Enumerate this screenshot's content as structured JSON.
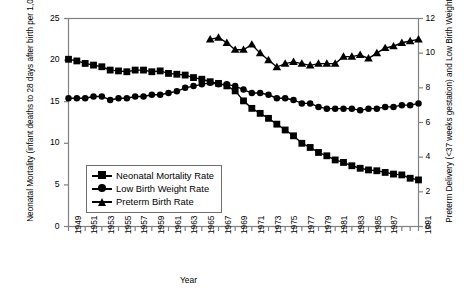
{
  "chart_data": {
    "type": "line",
    "title": "",
    "xlabel": "Year",
    "ylabel": "Neonatal Mortality (infant deaths to 28 days after birth per 1,000 live births)",
    "ylabel_right": "Preterm Delivery (<37 weeks gestation) and Low Birth Weight (<2,500 grams) (per 100 live births)",
    "ylim": [
      0,
      25
    ],
    "ylim_right": [
      0,
      12
    ],
    "yticks": [
      0,
      5,
      10,
      15,
      20,
      25
    ],
    "yticks_right": [
      0,
      2,
      4,
      6,
      8,
      10,
      12
    ],
    "xlim": [
      1949,
      1991
    ],
    "xticks": [
      1949,
      1950,
      1951,
      1952,
      1953,
      1954,
      1955,
      1956,
      1957,
      1958,
      1959,
      1960,
      1961,
      1962,
      1963,
      1964,
      1965,
      1966,
      1967,
      1968,
      1969,
      1970,
      1971,
      1972,
      1973,
      1974,
      1975,
      1976,
      1977,
      1978,
      1979,
      1980,
      1981,
      1982,
      1983,
      1984,
      1985,
      1986,
      1987,
      1988,
      1989,
      1990,
      1991
    ],
    "xtick_labels": [
      "1949",
      "",
      "1951",
      "",
      "1953",
      "",
      "1955",
      "",
      "1957",
      "",
      "1959",
      "",
      "1961",
      "",
      "1963",
      "",
      "1965",
      "",
      "1967",
      "",
      "1969",
      "",
      "1971",
      "",
      "1973",
      "",
      "1975",
      "",
      "1977",
      "",
      "1979",
      "",
      "1981",
      "",
      "1983",
      "",
      "1985",
      "",
      "1987",
      "",
      "",
      "",
      "1991"
    ],
    "grid": false,
    "legend_position": "lower-left-inside",
    "series": [
      {
        "name": "Neonatal Mortality Rate",
        "marker": "square",
        "axis": "left",
        "x": [
          1949,
          1950,
          1951,
          1952,
          1953,
          1954,
          1955,
          1956,
          1957,
          1958,
          1959,
          1960,
          1961,
          1962,
          1963,
          1964,
          1965,
          1966,
          1967,
          1968,
          1969,
          1970,
          1971,
          1972,
          1973,
          1974,
          1975,
          1976,
          1977,
          1978,
          1979,
          1980,
          1981,
          1982,
          1983,
          1984,
          1985,
          1986,
          1987,
          1988,
          1989,
          1990,
          1991
        ],
        "values": [
          20.1,
          19.9,
          19.6,
          19.4,
          19.2,
          18.8,
          18.7,
          18.6,
          18.8,
          18.8,
          18.6,
          18.7,
          18.4,
          18.3,
          18.2,
          17.9,
          17.7,
          17.4,
          17.2,
          16.9,
          16.3,
          15.1,
          14.2,
          13.6,
          13.0,
          12.3,
          11.6,
          10.9,
          10.0,
          9.5,
          8.9,
          8.5,
          8.0,
          7.7,
          7.3,
          7.0,
          6.8,
          6.7,
          6.5,
          6.3,
          6.2,
          5.8,
          5.6
        ]
      },
      {
        "name": "Low Birth Weight Rate",
        "marker": "circle",
        "axis": "right",
        "x": [
          1949,
          1950,
          1951,
          1952,
          1953,
          1954,
          1955,
          1956,
          1957,
          1958,
          1959,
          1960,
          1961,
          1962,
          1963,
          1964,
          1965,
          1966,
          1967,
          1968,
          1969,
          1970,
          1971,
          1972,
          1973,
          1974,
          1975,
          1976,
          1977,
          1978,
          1979,
          1980,
          1981,
          1982,
          1983,
          1984,
          1985,
          1986,
          1987,
          1988,
          1989,
          1990,
          1991
        ],
        "values": [
          7.4,
          7.4,
          7.4,
          7.5,
          7.5,
          7.3,
          7.4,
          7.4,
          7.5,
          7.5,
          7.6,
          7.6,
          7.7,
          7.8,
          8.0,
          8.1,
          8.2,
          8.3,
          8.2,
          8.2,
          8.1,
          7.9,
          7.7,
          7.7,
          7.6,
          7.4,
          7.4,
          7.3,
          7.1,
          7.1,
          6.9,
          6.8,
          6.8,
          6.8,
          6.8,
          6.7,
          6.8,
          6.8,
          6.9,
          6.9,
          7.0,
          7.0,
          7.1
        ]
      },
      {
        "name": "Preterm Birth Rate",
        "marker": "triangle",
        "axis": "right",
        "x": [
          1966,
          1967,
          1968,
          1969,
          1970,
          1971,
          1972,
          1973,
          1974,
          1975,
          1976,
          1977,
          1978,
          1979,
          1980,
          1981,
          1982,
          1983,
          1984,
          1985,
          1986,
          1987,
          1988,
          1989,
          1990,
          1991
        ],
        "values": [
          10.8,
          10.9,
          10.6,
          10.2,
          10.2,
          10.5,
          10.0,
          9.6,
          9.2,
          9.4,
          9.5,
          9.4,
          9.3,
          9.4,
          9.4,
          9.4,
          9.8,
          9.8,
          9.9,
          9.7,
          10.0,
          10.3,
          10.4,
          10.6,
          10.7,
          10.8
        ]
      }
    ]
  },
  "legend": {
    "items": [
      {
        "label": "Neonatal Mortality Rate",
        "marker": "square"
      },
      {
        "label": "Low Birth Weight Rate",
        "marker": "circle"
      },
      {
        "label": "Preterm Birth Rate",
        "marker": "triangle"
      }
    ]
  },
  "colors": {
    "series": "#000000",
    "axis": "#808080",
    "text": "#000000",
    "background": "#ffffff"
  }
}
